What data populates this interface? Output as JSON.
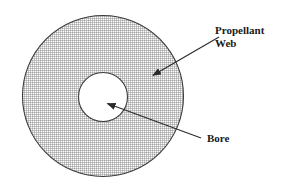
{
  "figure": {
    "type": "cross-section-diagram",
    "background_color": "#ffffff",
    "outline_color": "#3c3c3c",
    "hatch_color": "#b4b4b4",
    "text_color": "#1a1a1a"
  },
  "shapes": {
    "outer_circle": {
      "name": "propellant-grain-outer-circle",
      "cx": 103,
      "cy": 96,
      "r": 81,
      "fill": "hatched",
      "stroke": "#3c3c3c"
    },
    "inner_circle": {
      "name": "bore-circle",
      "cx": 103,
      "cy": 97,
      "r": 25,
      "fill": "#ffffff",
      "stroke": "#3c3c3c"
    }
  },
  "annotations": [
    {
      "id": "propellant-web",
      "label_line_1": "Propellant",
      "label_line_2": "Web",
      "label_x": 215,
      "label_y_1": 34,
      "label_y_2": 47,
      "leader": {
        "tail_x": 219,
        "tail_y": 37,
        "head_x": 152,
        "head_y": 76
      }
    },
    {
      "id": "bore",
      "label_line_1": "Bore",
      "label_line_2": "",
      "label_x": 207,
      "label_y_1": 142,
      "label_y_2": null,
      "leader": {
        "tail_x": 201,
        "tail_y": 138,
        "head_x": 106,
        "head_y": 103
      }
    }
  ]
}
